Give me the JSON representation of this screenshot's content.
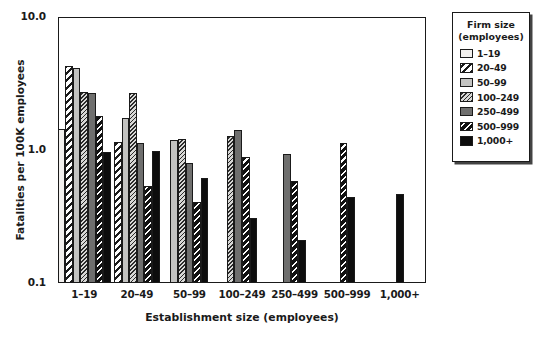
{
  "chart_data": {
    "type": "bar",
    "title": "Fatality Rate by Firm Size, Holding Establishment Size Constant (Wholesale)",
    "title_line1": "Fatality Rate by Firm Size, Holding Establishment",
    "title_line2": "Size Constant (Wholesale)",
    "xlabel": "Establishment size (employees)",
    "ylabel": "Fatalities per 100K employees",
    "yscale": "log",
    "ylim": [
      0.1,
      10.0
    ],
    "ytick_labels": [
      "10.0",
      "1.0",
      "0.1"
    ],
    "ytick_values": [
      10.0,
      1.0,
      0.1
    ],
    "grid": false,
    "legend_position": "right-outside",
    "legend_title_line1": "Firm size",
    "legend_title_line2": "(employees)",
    "categories": [
      "1–19",
      "20–49",
      "50–99",
      "100–249",
      "250–499",
      "500–999",
      "1,000+"
    ],
    "series": [
      {
        "name": "1–19",
        "pattern": "solid-very-light",
        "color": "#f2f0ee",
        "values": [
          1.45,
          null,
          null,
          null,
          null,
          null,
          null
        ]
      },
      {
        "name": "20–49",
        "pattern": "thick-diagonal-stripe",
        "color": "#ffffff",
        "values": [
          4.3,
          1.15,
          null,
          null,
          null,
          null,
          null
        ]
      },
      {
        "name": "50–99",
        "pattern": "solid-light-gray",
        "color": "#c3c3c1",
        "values": [
          4.15,
          1.75,
          1.18,
          null,
          null,
          null,
          null
        ]
      },
      {
        "name": "100–249",
        "pattern": "fine-diagonal-hatch",
        "color": "#d8d8d6",
        "values": [
          2.75,
          2.7,
          1.2,
          1.28,
          null,
          null,
          null
        ]
      },
      {
        "name": "250–499",
        "pattern": "solid-medium-gray",
        "color": "#6f6f6e",
        "values": [
          2.7,
          1.12,
          0.8,
          1.42,
          0.93,
          null,
          null
        ]
      },
      {
        "name": "500–999",
        "pattern": "white-diagonal-stripe-on-black",
        "color": "#111111",
        "values": [
          1.8,
          0.54,
          0.41,
          0.88,
          0.58,
          1.13,
          null
        ]
      },
      {
        "name": "1,000+",
        "pattern": "solid-black",
        "color": "#0d0d0d",
        "values": [
          0.96,
          0.98,
          0.62,
          0.31,
          0.21,
          0.44,
          0.47
        ]
      }
    ]
  },
  "legend": {
    "title_line1": "Firm size",
    "title_line2": "(employees)",
    "items": [
      {
        "label": "1–19"
      },
      {
        "label": "20–49"
      },
      {
        "label": "50–99"
      },
      {
        "label": "100–249"
      },
      {
        "label": "250–499"
      },
      {
        "label": "500–999"
      },
      {
        "label": "1,000+"
      }
    ]
  }
}
